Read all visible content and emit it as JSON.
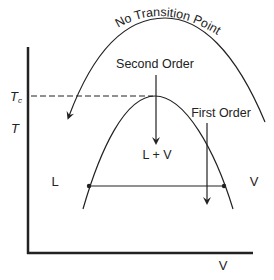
{
  "diagram": {
    "curve_label": "No Transition Point",
    "second_order_label": "Second Order",
    "first_order_label": "First Order",
    "two_phase_label": "L + V",
    "liquid_label": "L",
    "vapor_label": "V",
    "tc_label_main": "T",
    "tc_label_sub": "c",
    "y_axis_label": "T",
    "x_axis_label": "V",
    "colors": {
      "line": "#222222",
      "background": "#ffffff"
    }
  }
}
